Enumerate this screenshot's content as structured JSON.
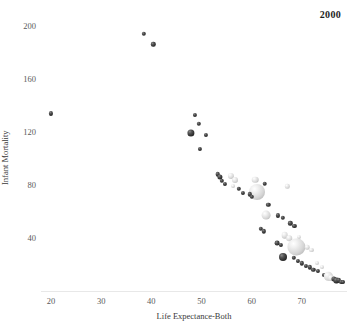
{
  "chart_data": {
    "type": "scatter",
    "title": "",
    "year_label": "2000",
    "xlabel": "Life Expectance-Both",
    "ylabel": "Infant Mortality",
    "xlim": [
      18,
      79
    ],
    "ylim": [
      0,
      212
    ],
    "xticks": [
      20,
      30,
      40,
      50,
      60,
      70
    ],
    "xtick_labels": [
      "20",
      "30",
      "40",
      "50",
      "60",
      "70"
    ],
    "yticks": [
      40,
      80,
      120,
      160,
      200
    ],
    "ytick_labels": [
      "40",
      "80",
      "120",
      "160",
      "200"
    ],
    "grid": false,
    "legend": "none",
    "size_encoding": "population",
    "color_encoding": "greyscale-region",
    "points": [
      {
        "x": 38.5,
        "y": 194,
        "r": 2.2,
        "shade": "dark"
      },
      {
        "x": 40.4,
        "y": 186,
        "r": 2.2,
        "shade": "dark"
      },
      {
        "x": 20.0,
        "y": 134,
        "r": 2.1,
        "shade": "dark"
      },
      {
        "x": 48.6,
        "y": 133,
        "r": 2.1,
        "shade": "dark"
      },
      {
        "x": 49.5,
        "y": 126,
        "r": 2.2,
        "shade": "dark"
      },
      {
        "x": 50.9,
        "y": 118,
        "r": 2.1,
        "shade": "dark"
      },
      {
        "x": 47.9,
        "y": 119,
        "r": 3.6,
        "shade": "dark"
      },
      {
        "x": 49.6,
        "y": 107,
        "r": 2.1,
        "shade": "dark"
      },
      {
        "x": 53.2,
        "y": 88,
        "r": 2.3,
        "shade": "dark"
      },
      {
        "x": 53.7,
        "y": 86,
        "r": 2.6,
        "shade": "dark"
      },
      {
        "x": 54.1,
        "y": 83,
        "r": 2.2,
        "shade": "dark"
      },
      {
        "x": 54.6,
        "y": 81,
        "r": 2.1,
        "shade": "dark"
      },
      {
        "x": 55.8,
        "y": 87,
        "r": 3.1,
        "shade": "light"
      },
      {
        "x": 56.6,
        "y": 84,
        "r": 3.0,
        "shade": "light"
      },
      {
        "x": 56.2,
        "y": 79,
        "r": 2.0,
        "shade": "light"
      },
      {
        "x": 57.4,
        "y": 77,
        "r": 2.2,
        "shade": "dark"
      },
      {
        "x": 58.2,
        "y": 74,
        "r": 2.1,
        "shade": "dark"
      },
      {
        "x": 60.7,
        "y": 84,
        "r": 3.3,
        "shade": "light"
      },
      {
        "x": 62.6,
        "y": 81,
        "r": 2.3,
        "shade": "dark"
      },
      {
        "x": 61.1,
        "y": 75,
        "r": 8.0,
        "shade": "light"
      },
      {
        "x": 59.6,
        "y": 73,
        "r": 2.2,
        "shade": "dark"
      },
      {
        "x": 60.0,
        "y": 71,
        "r": 2.2,
        "shade": "dark"
      },
      {
        "x": 67.1,
        "y": 79,
        "r": 2.2,
        "shade": "light"
      },
      {
        "x": 63.3,
        "y": 65,
        "r": 2.2,
        "shade": "dark"
      },
      {
        "x": 62.9,
        "y": 57,
        "r": 4.4,
        "shade": "light"
      },
      {
        "x": 65.2,
        "y": 57,
        "r": 2.1,
        "shade": "dark"
      },
      {
        "x": 66.2,
        "y": 55,
        "r": 2.2,
        "shade": "dark"
      },
      {
        "x": 61.8,
        "y": 47,
        "r": 2.2,
        "shade": "dark"
      },
      {
        "x": 62.4,
        "y": 45,
        "r": 2.2,
        "shade": "dark"
      },
      {
        "x": 67.7,
        "y": 51,
        "r": 2.2,
        "shade": "dark"
      },
      {
        "x": 68.5,
        "y": 49,
        "r": 2.1,
        "shade": "dark"
      },
      {
        "x": 66.6,
        "y": 42,
        "r": 3.3,
        "shade": "light"
      },
      {
        "x": 67.5,
        "y": 40,
        "r": 2.8,
        "shade": "light"
      },
      {
        "x": 69.4,
        "y": 41,
        "r": 2.1,
        "shade": "light"
      },
      {
        "x": 65.1,
        "y": 36,
        "r": 2.4,
        "shade": "dark"
      },
      {
        "x": 65.9,
        "y": 35,
        "r": 2.1,
        "shade": "dark"
      },
      {
        "x": 68.9,
        "y": 33,
        "r": 8.6,
        "shade": "light"
      },
      {
        "x": 71.1,
        "y": 33,
        "r": 2.3,
        "shade": "light"
      },
      {
        "x": 71.9,
        "y": 31,
        "r": 2.1,
        "shade": "light"
      },
      {
        "x": 66.2,
        "y": 26,
        "r": 4.0,
        "shade": "dark"
      },
      {
        "x": 68.4,
        "y": 25,
        "r": 2.2,
        "shade": "dark"
      },
      {
        "x": 69.2,
        "y": 23,
        "r": 2.1,
        "shade": "dark"
      },
      {
        "x": 70.0,
        "y": 21,
        "r": 2.2,
        "shade": "dark"
      },
      {
        "x": 70.8,
        "y": 19,
        "r": 2.1,
        "shade": "dark"
      },
      {
        "x": 71.6,
        "y": 18,
        "r": 2.2,
        "shade": "dark"
      },
      {
        "x": 72.3,
        "y": 16,
        "r": 2.2,
        "shade": "dark"
      },
      {
        "x": 73.2,
        "y": 15,
        "r": 2.1,
        "shade": "dark"
      },
      {
        "x": 73.0,
        "y": 21,
        "r": 2.0,
        "shade": "light"
      },
      {
        "x": 74.0,
        "y": 18,
        "r": 2.0,
        "shade": "light"
      },
      {
        "x": 74.4,
        "y": 12,
        "r": 2.1,
        "shade": "dark"
      },
      {
        "x": 75.3,
        "y": 11,
        "r": 4.2,
        "shade": "light"
      },
      {
        "x": 75.9,
        "y": 10,
        "r": 3.0,
        "shade": "light"
      },
      {
        "x": 76.4,
        "y": 9,
        "r": 2.6,
        "shade": "dark"
      },
      {
        "x": 76.9,
        "y": 8,
        "r": 2.6,
        "shade": "dark"
      },
      {
        "x": 77.4,
        "y": 8,
        "r": 2.2,
        "shade": "dark"
      },
      {
        "x": 77.9,
        "y": 7,
        "r": 2.1,
        "shade": "dark"
      },
      {
        "x": 78.3,
        "y": 7,
        "r": 2.0,
        "shade": "dark"
      }
    ]
  }
}
